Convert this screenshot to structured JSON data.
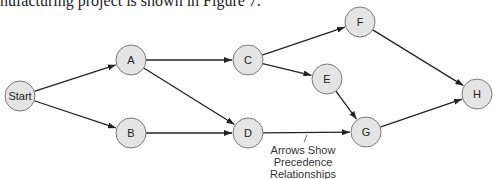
{
  "caption": "nufacturing project is shown in Figure 7.",
  "colors": {
    "node_fill": "#e4e4e4",
    "node_stroke": "#7a7a7a",
    "edge": "#222222",
    "text": "#222222"
  },
  "nodes": [
    {
      "id": "Start",
      "label": "Start",
      "x": 20,
      "y": 96
    },
    {
      "id": "A",
      "label": "A",
      "x": 131,
      "y": 60
    },
    {
      "id": "B",
      "label": "B",
      "x": 131,
      "y": 133
    },
    {
      "id": "C",
      "label": "C",
      "x": 248,
      "y": 60
    },
    {
      "id": "D",
      "label": "D",
      "x": 248,
      "y": 133
    },
    {
      "id": "E",
      "label": "E",
      "x": 327,
      "y": 79
    },
    {
      "id": "F",
      "label": "F",
      "x": 360,
      "y": 22
    },
    {
      "id": "G",
      "label": "G",
      "x": 366,
      "y": 132
    },
    {
      "id": "H",
      "label": "H",
      "x": 477,
      "y": 94
    }
  ],
  "edges": [
    {
      "from": "Start",
      "to": "A"
    },
    {
      "from": "Start",
      "to": "B"
    },
    {
      "from": "A",
      "to": "C"
    },
    {
      "from": "A",
      "to": "D"
    },
    {
      "from": "B",
      "to": "D"
    },
    {
      "from": "C",
      "to": "F"
    },
    {
      "from": "C",
      "to": "E"
    },
    {
      "from": "D",
      "to": "G"
    },
    {
      "from": "E",
      "to": "G"
    },
    {
      "from": "F",
      "to": "H"
    },
    {
      "from": "G",
      "to": "H"
    }
  ],
  "annotation": {
    "lines": [
      "Arrows Show",
      "Precedence",
      "Relationships"
    ],
    "x": 303,
    "y": 150
  }
}
